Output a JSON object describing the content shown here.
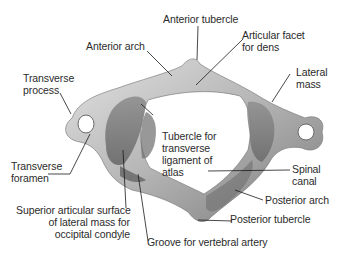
{
  "figure": {
    "colors": {
      "background": "#ffffff",
      "text": "#2b2b2b",
      "leader_line": "#1a1a1a",
      "bone_light": "#d9d9d9",
      "bone_mid": "#9c9c9c",
      "bone_dark": "#5e5e5e"
    },
    "labels": {
      "anterior_tubercle": "Anterior tubercle",
      "anterior_arch": "Anterior arch",
      "articular_facet": "Articular facet\nfor dens",
      "lateral_mass": "Lateral\nmass",
      "transverse_process": "Transverse\nprocess",
      "tubercle_transverse_ligament": "Tubercle for\ntransverse\nligament of\natlas",
      "transverse_foramen": "Transverse\nforamen",
      "spinal_canal": "Spinal\ncanal",
      "posterior_arch": "Posterior arch",
      "superior_articular_surface": "Superior articular surface\nof lateral mass for\noccipital condyle",
      "posterior_tubercle": "Posterior tubercle",
      "groove_vertebral_artery": "Groove for vertebral artery"
    }
  }
}
